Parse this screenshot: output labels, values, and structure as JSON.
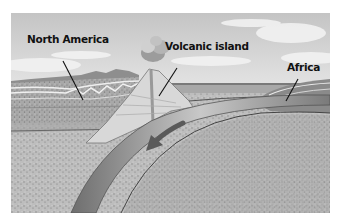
{
  "diagram": {
    "type": "cross-section",
    "labels": {
      "north_america": "North America",
      "volcanic_island": "Volcanic island",
      "africa": "Africa"
    },
    "elements": [
      "sky-with-clouds",
      "north-america-continental-crust",
      "volcanic-island-with-eruption-plume",
      "ocean-surface",
      "africa-continental-crust",
      "subducting-oceanic-plate",
      "subduction-direction-arrow",
      "mantle"
    ],
    "colors": {
      "sky": "#d6d6d6",
      "cloud": "#f4f4f4",
      "crust": "#9a9a9a",
      "mantle": "#b8b8b8",
      "plate": "#8c8c8c",
      "arrow": "#5a5a5a",
      "ink": "#111111"
    }
  }
}
